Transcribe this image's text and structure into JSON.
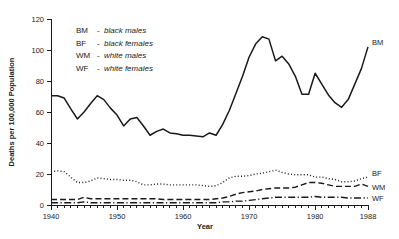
{
  "chart_data": {
    "type": "line",
    "title": "",
    "xlabel": "Year",
    "ylabel": "Deaths per 100,000 Population",
    "xlim": [
      1940,
      1988
    ],
    "ylim": [
      0,
      120
    ],
    "yticks": [
      0,
      20,
      40,
      60,
      80,
      100,
      120
    ],
    "xticks": [
      1940,
      1950,
      1960,
      1970,
      1980,
      1988
    ],
    "xtick_labels": [
      "1940",
      "1950",
      "1960",
      "1970",
      "1980",
      "1988"
    ],
    "ytick_labels": [
      "0",
      "20",
      "40",
      "60",
      "80",
      "100",
      "120"
    ],
    "x_minor_tick_step": 1,
    "grid": false,
    "legend_position": "upper-left-inside",
    "x": [
      1940,
      1941,
      1942,
      1943,
      1944,
      1945,
      1946,
      1947,
      1948,
      1949,
      1950,
      1951,
      1952,
      1953,
      1954,
      1955,
      1956,
      1957,
      1958,
      1959,
      1960,
      1961,
      1962,
      1963,
      1964,
      1965,
      1966,
      1967,
      1968,
      1969,
      1970,
      1971,
      1972,
      1973,
      1974,
      1975,
      1976,
      1977,
      1978,
      1979,
      1980,
      1981,
      1982,
      1983,
      1984,
      1985,
      1986,
      1987,
      1988
    ],
    "series": [
      {
        "name": "BM",
        "label": "BM",
        "description": "black males",
        "line_style": "solid",
        "color": "#1a1a1a",
        "values": [
          70.5,
          70.5,
          69.0,
          62.0,
          55.5,
          60.0,
          65.5,
          70.5,
          68.0,
          62.5,
          58.0,
          51.0,
          55.5,
          56.5,
          51.0,
          45.0,
          47.5,
          49.0,
          46.5,
          46.0,
          45.0,
          45.0,
          44.5,
          44.0,
          46.5,
          45.0,
          52.0,
          61.0,
          72.0,
          83.0,
          95.5,
          104.0,
          108.5,
          107.0,
          93.0,
          96.0,
          91.0,
          83.0,
          71.5,
          71.5,
          85.0,
          78.0,
          71.0,
          66.0,
          63.0,
          68.0,
          78.0,
          88.0,
          102.0
        ]
      },
      {
        "name": "BF",
        "label": "BF",
        "description": "black females",
        "line_style": "dotted",
        "color": "#1a1a1a",
        "values": [
          21.5,
          22.0,
          21.5,
          18.0,
          14.5,
          14.5,
          15.5,
          17.5,
          17.0,
          16.5,
          16.5,
          16.0,
          16.0,
          15.0,
          13.0,
          13.0,
          13.5,
          13.5,
          13.0,
          13.0,
          13.0,
          13.0,
          13.0,
          12.5,
          12.0,
          12.5,
          14.5,
          17.5,
          18.5,
          18.5,
          19.0,
          20.0,
          20.5,
          21.5,
          22.5,
          21.0,
          20.0,
          19.5,
          19.5,
          19.5,
          18.0,
          18.0,
          17.0,
          16.5,
          15.0,
          15.0,
          15.5,
          17.0,
          18.0
        ]
      },
      {
        "name": "WM",
        "label": "WM",
        "description": "white males",
        "line_style": "dashed",
        "color": "#1a1a1a",
        "values": [
          3.5,
          3.5,
          3.5,
          3.5,
          3.5,
          5.0,
          4.0,
          4.0,
          4.0,
          4.0,
          4.0,
          4.0,
          4.0,
          4.0,
          4.0,
          4.0,
          4.0,
          3.5,
          3.5,
          3.5,
          3.5,
          3.5,
          3.5,
          3.5,
          3.5,
          4.0,
          4.5,
          5.5,
          7.0,
          8.0,
          8.5,
          9.0,
          10.0,
          10.5,
          11.0,
          11.0,
          11.0,
          11.5,
          13.0,
          14.5,
          14.5,
          14.0,
          13.0,
          12.0,
          12.0,
          12.0,
          12.0,
          13.5,
          12.0
        ]
      },
      {
        "name": "WF",
        "label": "WF",
        "description": "white females",
        "line_style": "dashdot",
        "color": "#1a1a1a",
        "values": [
          1.5,
          1.5,
          1.5,
          1.5,
          1.5,
          2.0,
          1.5,
          1.5,
          1.5,
          1.5,
          1.5,
          1.5,
          1.5,
          1.5,
          1.5,
          1.5,
          1.5,
          1.5,
          1.5,
          1.5,
          1.5,
          1.5,
          1.5,
          1.5,
          1.5,
          1.5,
          2.0,
          2.0,
          2.5,
          2.5,
          3.0,
          3.5,
          4.0,
          4.5,
          5.0,
          5.0,
          5.0,
          5.0,
          5.0,
          5.0,
          5.5,
          5.0,
          5.0,
          5.0,
          5.0,
          4.5,
          4.5,
          4.5,
          4.5
        ]
      }
    ],
    "legend": [
      {
        "code": "BM",
        "dash": "-",
        "description": "black males"
      },
      {
        "code": "BF",
        "dash": "-",
        "description": "black females"
      },
      {
        "code": "WM",
        "dash": "-",
        "description": "white males"
      },
      {
        "code": "WF",
        "dash": "-",
        "description": "white females"
      }
    ],
    "end_labels": [
      {
        "name": "BM",
        "label": "BM"
      },
      {
        "name": "BF",
        "label": "BF"
      },
      {
        "name": "WM",
        "label": "WM"
      },
      {
        "name": "WF",
        "label": "WF"
      }
    ]
  }
}
